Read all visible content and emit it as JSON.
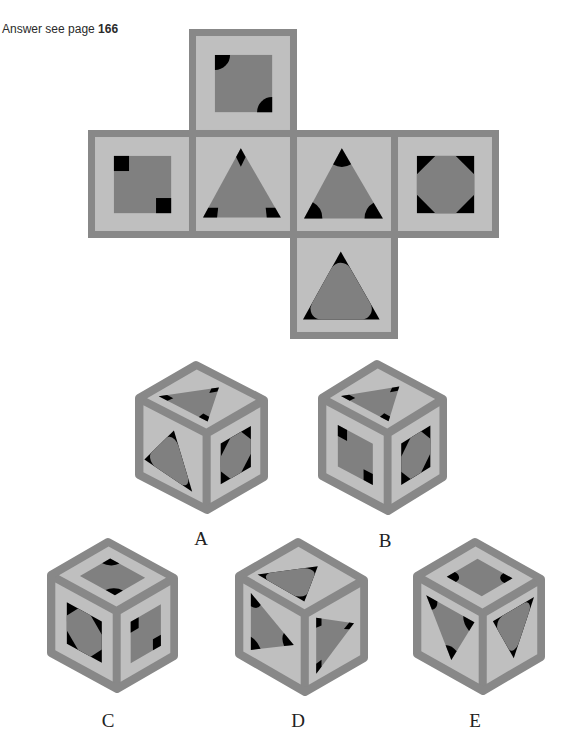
{
  "header": {
    "answer_prefix": "Answer see page",
    "answer_page": "166"
  },
  "net": {
    "faces": [
      {
        "position": "top",
        "motif": "square-with-quarter-circles"
      },
      {
        "position": "left",
        "motif": "square-with-black-squares"
      },
      {
        "position": "front",
        "motif": "triangle-with-diamond-tips"
      },
      {
        "position": "right",
        "motif": "triangle-with-round-sectors"
      },
      {
        "position": "back",
        "motif": "octagon-in-black-square"
      },
      {
        "position": "bottom",
        "motif": "triangle-with-thin-tips"
      }
    ]
  },
  "options": [
    {
      "label": "A",
      "faces": {
        "top": "triangle-with-diamond-tips",
        "left": "triangle-with-thin-tips",
        "right": "octagon-in-black-square"
      }
    },
    {
      "label": "B",
      "faces": {
        "top": "triangle-with-diamond-tips",
        "left": "square-with-black-squares",
        "right": "octagon-in-black-square"
      }
    },
    {
      "label": "C",
      "faces": {
        "top": "square-with-quarter-circles",
        "left": "octagon-in-black-square",
        "right": "square-with-black-squares"
      }
    },
    {
      "label": "D",
      "faces": {
        "top": "triangle-with-thin-tips",
        "left": "triangle-with-round-sectors",
        "right": "triangle-with-diamond-tips"
      }
    },
    {
      "label": "E",
      "faces": {
        "top": "square-with-quarter-circles",
        "left": "triangle-with-round-sectors",
        "right": "triangle-with-thin-tips"
      }
    }
  ],
  "colors": {
    "border": "#888888",
    "face_light": "#bfbfbf",
    "shape_dark": "#808080",
    "accent_black": "#000000"
  }
}
